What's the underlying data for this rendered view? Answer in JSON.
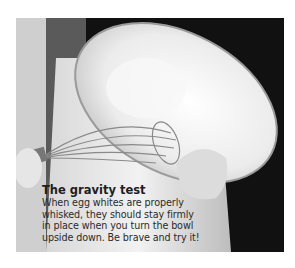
{
  "figure": {
    "image": {
      "description": "Black-and-white photo of a person holding an upturned glass bowl of whisked egg whites with a balloon whisk",
      "icon": "photo-egg-whites-bowl"
    },
    "caption": {
      "title": "The gravity test",
      "lines": [
        "When egg whites are properly",
        "whisked, they should stay firmly",
        "in place when you turn the bowl",
        "upside down. Be brave and try it!"
      ]
    }
  }
}
